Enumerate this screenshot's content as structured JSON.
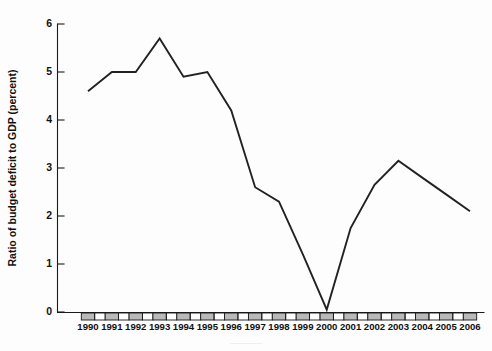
{
  "figure": {
    "background_color": "#fdfdfd",
    "line_color": "#222222",
    "axis_color": "#1a1a1a",
    "tick_band_color": "#b9b9b9"
  },
  "chart_data": {
    "type": "line",
    "title": "",
    "xlabel": "",
    "ylabel": "Ratio of budget deficit to GDP (percent)",
    "categories": [
      "1990",
      "1991",
      "1992",
      "1993",
      "1994",
      "1995",
      "1996",
      "1997",
      "1998",
      "1999",
      "2000",
      "2001",
      "2002",
      "2003",
      "2004",
      "2005",
      "2006"
    ],
    "x": [
      1990,
      1991,
      1992,
      1993,
      1994,
      1995,
      1996,
      1997,
      1998,
      1999,
      2000,
      2001,
      2002,
      2003,
      2004,
      2005,
      2006
    ],
    "values": [
      4.6,
      5.0,
      5.0,
      5.7,
      4.9,
      5.0,
      4.2,
      2.6,
      2.3,
      1.2,
      0.05,
      1.75,
      2.65,
      3.15,
      2.8,
      2.45,
      2.1
    ],
    "series": [
      {
        "name": "Ratio of budget deficit to GDP",
        "values": [
          4.6,
          5.0,
          5.0,
          5.7,
          4.9,
          5.0,
          4.2,
          2.6,
          2.3,
          1.2,
          0.05,
          1.75,
          2.65,
          3.15,
          2.8,
          2.45,
          2.1
        ]
      }
    ],
    "ylim": [
      0,
      6
    ],
    "xlim": [
      1990,
      2006
    ],
    "yticks": [
      0,
      1,
      2,
      3,
      4,
      5,
      6
    ],
    "ytick_labels": [
      "0",
      "1",
      "2",
      "3",
      "4",
      "5",
      "6"
    ],
    "xtick_labels": [
      "1990",
      "1991",
      "1992",
      "1993",
      "1994",
      "1995",
      "1996",
      "1997",
      "1998",
      "1999",
      "2000",
      "2001",
      "2002",
      "2003",
      "2004",
      "2005",
      "2006"
    ],
    "grid": false,
    "legend": null,
    "legend_position": "none",
    "annotations": []
  },
  "axes": {
    "y_axis_label": "Ratio of budget deficit to GDP (percent)",
    "y_tick_0": "0",
    "y_tick_1": "1",
    "y_tick_2": "2",
    "y_tick_3": "3",
    "y_tick_4": "4",
    "y_tick_5": "5",
    "y_tick_6": "6"
  }
}
